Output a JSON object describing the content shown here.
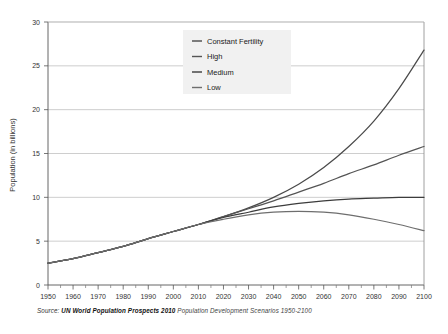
{
  "chart_data": {
    "type": "line",
    "title": "",
    "xlabel": "",
    "ylabel": "Population (in billions)",
    "xlim": [
      1950,
      2100
    ],
    "ylim": [
      0,
      30
    ],
    "grid": true,
    "legend_position": "top-center",
    "x": [
      1950,
      1960,
      1970,
      1980,
      1990,
      2000,
      2010,
      2020,
      2030,
      2040,
      2050,
      2060,
      2070,
      2080,
      2090,
      2100
    ],
    "xticks": [
      "1950",
      "1960",
      "1970",
      "1980",
      "1990",
      "2000",
      "2010",
      "2020",
      "2030",
      "2040",
      "2050",
      "2060",
      "2070",
      "2080",
      "2090",
      "2100"
    ],
    "yticks": [
      "0",
      "5",
      "10",
      "15",
      "20",
      "25",
      "30"
    ],
    "ytick_values": [
      0,
      5,
      10,
      15,
      20,
      25,
      30
    ],
    "series": [
      {
        "name": "Constant Fertility",
        "color": "#4a4a4a",
        "values": [
          2.5,
          3.0,
          3.7,
          4.4,
          5.3,
          6.1,
          6.9,
          7.8,
          8.8,
          10.0,
          11.5,
          13.4,
          15.8,
          18.7,
          22.4,
          26.8
        ]
      },
      {
        "name": "High",
        "color": "#555555",
        "values": [
          2.5,
          3.0,
          3.7,
          4.4,
          5.3,
          6.1,
          6.9,
          7.8,
          8.7,
          9.6,
          10.6,
          11.6,
          12.7,
          13.7,
          14.8,
          15.8
        ]
      },
      {
        "name": "Medium",
        "color": "#3c3c3c",
        "values": [
          2.5,
          3.0,
          3.7,
          4.4,
          5.3,
          6.1,
          6.9,
          7.7,
          8.3,
          8.9,
          9.3,
          9.6,
          9.8,
          9.9,
          10.0,
          10.0
        ]
      },
      {
        "name": "Low",
        "color": "#6e6e6e",
        "values": [
          2.5,
          3.0,
          3.7,
          4.4,
          5.3,
          6.1,
          6.9,
          7.5,
          8.0,
          8.3,
          8.4,
          8.3,
          8.0,
          7.5,
          6.9,
          6.2
        ]
      }
    ]
  },
  "legend": {
    "items": [
      {
        "label": "Constant Fertility"
      },
      {
        "label": "High"
      },
      {
        "label": "Medium"
      },
      {
        "label": "Low"
      }
    ]
  },
  "axes": {
    "y_title": "Population (in billions)"
  },
  "caption": {
    "prefix": "Source:",
    "source_bold": "UN World Population Prospects 2010",
    "suffix": "Population Development Scenarios 1950-2100"
  }
}
